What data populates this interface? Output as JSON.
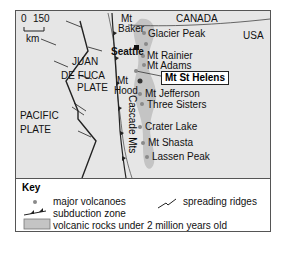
{
  "map": {
    "scale": {
      "zero": "0",
      "max": "150",
      "unit": "km"
    },
    "countries": {
      "north": "CANADA",
      "south": "USA"
    },
    "plates": {
      "juan_de_fuca": [
        "JUAN",
        "DE FUCA",
        "PLATE"
      ],
      "pacific": [
        "PACIFIC",
        "PLATE"
      ]
    },
    "city": "Seattle",
    "range": "Cascade Mts",
    "highlight": "Mt St Helens",
    "volcanoes": [
      {
        "name": "Mt Baker",
        "lines": [
          "Mt",
          "Baker"
        ]
      },
      {
        "name": "Glacier Peak"
      },
      {
        "name": "Mt Rainier"
      },
      {
        "name": "Mt Adams"
      },
      {
        "name": "Mt St Helens"
      },
      {
        "name": "Mt Hood",
        "lines": [
          "Mt",
          "Hood"
        ]
      },
      {
        "name": "Mt Jefferson"
      },
      {
        "name": "Three Sisters"
      },
      {
        "name": "Crater Lake"
      },
      {
        "name": "Mt Shasta"
      },
      {
        "name": "Lassen Peak"
      }
    ],
    "colors": {
      "ocean": "#e6e6e6",
      "volcanic_rock": "#c4c4c4",
      "volcano_dot": "#8a8a8a",
      "line": "#222222"
    }
  },
  "key": {
    "title": "Key",
    "items": [
      {
        "symbol": "dot",
        "label": "major volcanoes"
      },
      {
        "symbol": "spreading",
        "label": "spreading ridges"
      },
      {
        "symbol": "subduction",
        "label": "subduction zone"
      },
      {
        "symbol": "rock",
        "label": "volcanic rocks under 2 million years old"
      }
    ]
  }
}
